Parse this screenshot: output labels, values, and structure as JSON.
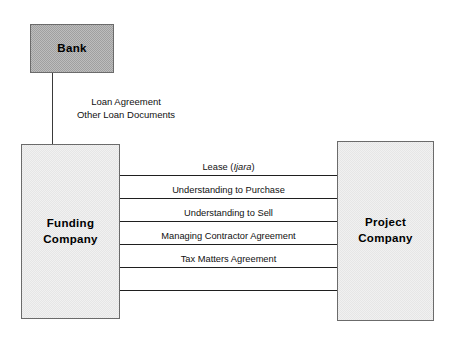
{
  "diagram": {
    "background_color": "#ffffff",
    "nodes": {
      "bank": {
        "label": "Bank",
        "fill_color": "#a0a0a0",
        "border_color": "#6b6b6b"
      },
      "funding_company": {
        "label": "Funding\nCompany",
        "fill_color": "#e6e6e6",
        "border_color": "#6b6b6b"
      },
      "project_company": {
        "label": "Project\nCompany",
        "fill_color": "#e6e6e6",
        "border_color": "#6b6b6b"
      }
    },
    "bank_link": {
      "label": "Loan Agreement\nOther Loan Documents"
    },
    "edges": [
      {
        "label_prefix": "Lease (",
        "label_italic": "Ijara",
        "label_suffix": ")"
      },
      {
        "label_prefix": "Understanding to Purchase",
        "label_italic": "",
        "label_suffix": ""
      },
      {
        "label_prefix": "Understanding to Sell",
        "label_italic": "",
        "label_suffix": ""
      },
      {
        "label_prefix": "Managing Contractor Agreement",
        "label_italic": "",
        "label_suffix": ""
      },
      {
        "label_prefix": "Tax Matters Agreement",
        "label_italic": "",
        "label_suffix": ""
      }
    ]
  }
}
